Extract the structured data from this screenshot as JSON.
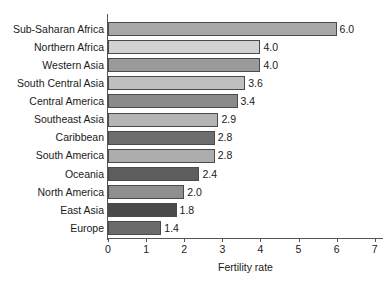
{
  "chart_data": {
    "type": "bar",
    "orientation": "horizontal",
    "title": "",
    "xlabel": "Fertility rate",
    "ylabel": "",
    "xlim": [
      0,
      7
    ],
    "xticks": [
      "0",
      "1",
      "2",
      "3",
      "4",
      "5",
      "6",
      "7"
    ],
    "grid": false,
    "legend": null,
    "categories": [
      "Sub-Saharan Africa",
      "Northern Africa",
      "Western Asia",
      "South Central Asia",
      "Central America",
      "Southeast Asia",
      "Caribbean",
      "South America",
      "Oceania",
      "North America",
      "East Asia",
      "Europe"
    ],
    "values": [
      6.0,
      4.0,
      4.0,
      3.6,
      3.4,
      2.9,
      2.8,
      2.8,
      2.4,
      2.0,
      1.8,
      1.4
    ],
    "value_labels": [
      "6.0",
      "4.0",
      "4.0",
      "3.6",
      "3.4",
      "2.9",
      "2.8",
      "2.8",
      "2.4",
      "2.0",
      "1.8",
      "1.4"
    ],
    "bar_colors": [
      "#a8a8a8",
      "#d2d2d2",
      "#9a9a9a",
      "#bfbfbf",
      "#8a8a8a",
      "#b4b4b4",
      "#6e6e6e",
      "#adadad",
      "#5d5d5d",
      "#8f8f8f",
      "#4a4a4a",
      "#6b6b6b"
    ],
    "bar_border_color": "#4a4a4a",
    "axis_color": "#555555",
    "text_color": "#1a1a1a",
    "background": "#ffffff"
  }
}
